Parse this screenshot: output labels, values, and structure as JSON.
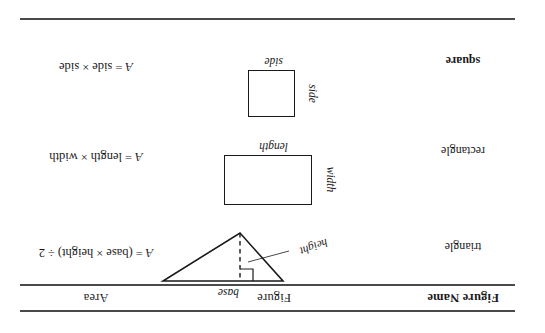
{
  "document": {
    "orientation": "upside-down",
    "rotation_degrees": 180,
    "background_color": "#ffffff",
    "ink_color": "#1a1a1a",
    "rule_color": "#4a4a4a"
  },
  "table": {
    "headers": {
      "figure_name": "Figure Name",
      "figure": "Figure",
      "area": "Area"
    },
    "rows": [
      {
        "name": "square",
        "figure_type": "square",
        "labels": {
          "bottom": "side",
          "left": "side"
        },
        "formula": {
          "lhs": "A",
          "equals": "=",
          "term1": "side",
          "operator": "×",
          "term2": "side",
          "full_text": "A = side × side"
        }
      },
      {
        "name": "rectangle",
        "figure_type": "rectangle",
        "labels": {
          "bottom": "length",
          "left": "width"
        },
        "formula": {
          "lhs": "A",
          "equals": "=",
          "term1": "length",
          "operator": "×",
          "term2": "width",
          "full_text": "A = length × width"
        }
      },
      {
        "name": "triangle",
        "figure_type": "triangle",
        "labels": {
          "bottom": "base",
          "altitude": "height"
        },
        "annotations": {
          "right_angle_marker": true,
          "altitude_style": "dashed",
          "leader_line": true
        },
        "formula": {
          "lhs": "A",
          "equals": "=",
          "open_paren": "(",
          "term1": "base",
          "operator": "×",
          "term2": "height",
          "close_paren": ")",
          "divide": "÷",
          "divisor": "2",
          "full_text": "A = (base × height) ÷ 2"
        }
      }
    ]
  }
}
